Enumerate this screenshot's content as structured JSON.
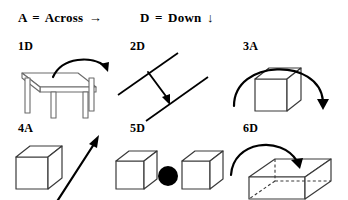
{
  "legend": {
    "across": {
      "key": "A",
      "equals": "=",
      "word": "Across",
      "arrow": "→",
      "arrow_name": "right-arrow-icon"
    },
    "down": {
      "key": "D",
      "equals": "=",
      "word": "Down",
      "arrow": "↓",
      "arrow_name": "down-arrow-icon"
    }
  },
  "items": [
    {
      "label": "1D",
      "figure": "table-with-curved-arrow",
      "figure_name": "figure-table-curved-arrow",
      "direction": "D"
    },
    {
      "label": "2D",
      "figure": "two-parallel-diagonal-lines-with-arrow",
      "figure_name": "figure-parallel-lines-arrow",
      "direction": "D"
    },
    {
      "label": "3A",
      "figure": "cube-with-arc-arrow",
      "figure_name": "figure-cube-arc-arrow",
      "direction": "A"
    },
    {
      "label": "4A",
      "figure": "cube-with-diagonal-arrow",
      "figure_name": "figure-cube-diagonal-arrow",
      "direction": "A"
    },
    {
      "label": "5D",
      "figure": "two-cubes-with-black-dot",
      "figure_name": "figure-two-cubes-dot",
      "direction": "D"
    },
    {
      "label": "6D",
      "figure": "wireframe-box-with-curved-arrow",
      "figure_name": "figure-wireframe-box-arrow",
      "direction": "D"
    }
  ],
  "colors": {
    "ink": "#000000",
    "line_grey": "#6b6b6b",
    "cube_edge": "#3a3a3a",
    "background": "#ffffff"
  }
}
